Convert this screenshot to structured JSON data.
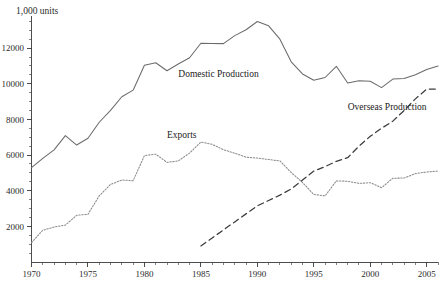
{
  "chart_data": {
    "type": "line",
    "title": "",
    "subtitle": "",
    "xlabel": "",
    "ylabel": "1,000 units",
    "unit_label": "1,000 units",
    "xlim": [
      1970,
      2006
    ],
    "ylim": [
      0,
      13800
    ],
    "grid": false,
    "legend_position": "inline-annotations",
    "x_tick_labels": [
      "1970",
      "1975",
      "1980",
      "1985",
      "1990",
      "1995",
      "2000",
      "2005"
    ],
    "x_tick_values": [
      1970,
      1975,
      1980,
      1985,
      1990,
      1995,
      2000,
      2005
    ],
    "x_minor_step": 1,
    "y_tick_labels": [
      "2000",
      "4000",
      "6000",
      "8000",
      "10000",
      "12000"
    ],
    "y_tick_values": [
      2000,
      4000,
      6000,
      8000,
      10000,
      12000
    ],
    "y_minor_step": 500,
    "x": [
      1970,
      1971,
      1972,
      1973,
      1974,
      1975,
      1976,
      1977,
      1978,
      1979,
      1980,
      1981,
      1982,
      1983,
      1984,
      1985,
      1986,
      1987,
      1988,
      1989,
      1990,
      1991,
      1992,
      1993,
      1994,
      1995,
      1996,
      1997,
      1998,
      1999,
      2000,
      2001,
      2002,
      2003,
      2004,
      2005,
      2006
    ],
    "series": [
      {
        "name": "Domestic Production",
        "label": "Domestic Production",
        "style": "solid",
        "color": "#6b6b6b",
        "values": [
          5290,
          5810,
          6290,
          7090,
          6560,
          6940,
          7840,
          8510,
          9270,
          9640,
          11040,
          11180,
          10730,
          11110,
          11460,
          12270,
          12260,
          12250,
          12700,
          13030,
          13490,
          13250,
          12500,
          11230,
          10550,
          10200,
          10350,
          10980,
          10040,
          10170,
          10140,
          9780,
          10260,
          10290,
          10510,
          10800,
          11000
        ]
      },
      {
        "name": "Exports",
        "label": "Exports",
        "style": "dotted",
        "color": "#8a8a8a",
        "values": [
          1090,
          1780,
          1960,
          2070,
          2620,
          2680,
          3710,
          4350,
          4600,
          4560,
          5970,
          6050,
          5590,
          5670,
          6110,
          6730,
          6600,
          6300,
          6100,
          5880,
          5830,
          5750,
          5670,
          5020,
          4460,
          3790,
          3710,
          4550,
          4530,
          4410,
          4450,
          4170,
          4700,
          4710,
          4960,
          5050,
          5100
        ]
      },
      {
        "name": "Overseas Production",
        "label": "Overseas Production",
        "style": "dashed",
        "color": "#3c3c3c",
        "values": [
          null,
          null,
          null,
          null,
          null,
          null,
          null,
          null,
          null,
          null,
          null,
          null,
          null,
          null,
          null,
          900,
          1350,
          1800,
          2250,
          2700,
          3150,
          3450,
          3750,
          4100,
          4600,
          5100,
          5350,
          5650,
          5850,
          6500,
          7050,
          7500,
          7900,
          8500,
          9150,
          9700,
          9700
        ]
      }
    ],
    "annotations": [
      {
        "text": "Domestic Production",
        "x": 1983,
        "y": 10400
      },
      {
        "text": "Exports",
        "x": 1982,
        "y": 6950
      },
      {
        "text": "Overseas Production",
        "x": 1998,
        "y": 8500
      },
      {
        "text": "1,000 units",
        "x": 1970,
        "y": 13700
      }
    ]
  }
}
